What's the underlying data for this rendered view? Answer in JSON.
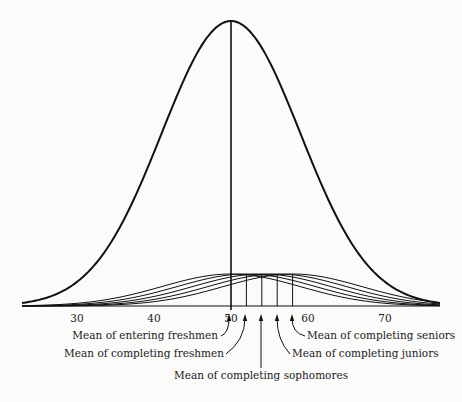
{
  "chart_data": {
    "type": "line",
    "title": "",
    "xlabel": "",
    "ylabel": "",
    "xlim": [
      23,
      77
    ],
    "x_ticks": [
      30,
      40,
      50,
      60,
      70
    ],
    "grid": false,
    "legend": null,
    "series": [
      {
        "name": "Reference (norm) distribution",
        "mean": 50,
        "sd": 9,
        "relative_height": 1.0,
        "stroke_width": 2
      },
      {
        "name": "Entering freshmen",
        "mean": 50,
        "sd": 9,
        "relative_height": 0.113,
        "stroke_width": 1
      },
      {
        "name": "Completing freshmen",
        "mean": 52,
        "sd": 9,
        "relative_height": 0.113,
        "stroke_width": 1
      },
      {
        "name": "Completing sophomores",
        "mean": 54,
        "sd": 9,
        "relative_height": 0.113,
        "stroke_width": 1
      },
      {
        "name": "Completing juniors",
        "mean": 56,
        "sd": 9,
        "relative_height": 0.113,
        "stroke_width": 1
      },
      {
        "name": "Completing seniors",
        "mean": 58,
        "sd": 9,
        "relative_height": 0.113,
        "stroke_width": 1
      }
    ],
    "mean_lines": [
      50,
      52,
      54,
      56,
      58
    ],
    "annotations": [
      {
        "text": "Mean of entering freshmen",
        "points_to": 50
      },
      {
        "text": "Mean of completing freshmen",
        "points_to": 52
      },
      {
        "text": "Mean of completing sophomores",
        "points_to": 54
      },
      {
        "text": "Mean of completing juniors",
        "points_to": 56
      },
      {
        "text": "Mean of completing seniors",
        "points_to": 58
      }
    ]
  },
  "colors": {
    "ink": "#111111",
    "paper": "#fbfbfa"
  }
}
